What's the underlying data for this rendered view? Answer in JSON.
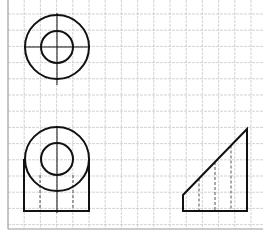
{
  "diagram": {
    "type": "orthographic-projection",
    "colors": {
      "background": "#ffffff",
      "grid": "#c8c8c8",
      "frame": "#9a9a9a",
      "line": "#111111",
      "hidden": "#555555"
    },
    "grid": {
      "x0": 8,
      "y0": -2,
      "step": 16.2,
      "cols": 16,
      "rows": 15,
      "left": 8,
      "bottom": 229
    },
    "views": [
      {
        "name": "top-view",
        "center": [
          57,
          47
        ],
        "outer_radius": 32,
        "inner_radius": 16,
        "centerline_h": [
          24,
          90
        ],
        "centerline_v": [
          13,
          85
        ]
      },
      {
        "name": "front-view",
        "center": [
          57,
          159
        ],
        "outer_radius": 32,
        "inner_radius": 16,
        "rect": {
          "x1": 24,
          "y1": 159,
          "x2": 89,
          "y2": 211
        },
        "hidden_lines_x": [
          40,
          73
        ],
        "centerline_x": 57,
        "centerline_y": [
          127,
          213
        ]
      },
      {
        "name": "side-view",
        "polygon": [
          [
            183,
            195
          ],
          [
            183,
            211
          ],
          [
            247,
            211
          ],
          [
            247,
            129
          ]
        ],
        "hidden_lines_x": [
          199,
          215,
          231
        ]
      }
    ]
  }
}
